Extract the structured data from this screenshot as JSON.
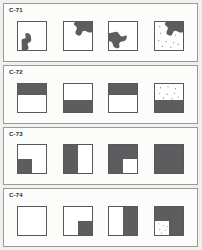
{
  "sheet": {
    "background_color": "#f0f0ee",
    "panel_background": "#fcfcfa",
    "panel_border_color": "#9a9a96",
    "fill_color": "#5d5d60",
    "cell_border_color": "#58585a"
  },
  "panels": [
    {
      "label": "C-71",
      "cells": [
        {
          "kind": "puzzle-piece",
          "position": "bottom-left",
          "dotted": false
        },
        {
          "kind": "puzzle-piece",
          "position": "top-right",
          "dotted": false
        },
        {
          "kind": "puzzle-piece",
          "position": "center-left",
          "dotted": false
        },
        {
          "kind": "puzzle-piece",
          "position": "top-right",
          "dotted": true
        }
      ]
    },
    {
      "label": "C-72",
      "cells": [
        {
          "kind": "band",
          "position": "top",
          "dotted": false
        },
        {
          "kind": "band",
          "position": "bottom",
          "dotted": false
        },
        {
          "kind": "band",
          "position": "top",
          "dotted": false
        },
        {
          "kind": "band",
          "position": "bottom",
          "dotted": true
        }
      ]
    },
    {
      "label": "C-73",
      "cells": [
        {
          "kind": "quadrants",
          "filled": [
            "bottom-left"
          ],
          "dotted": false
        },
        {
          "kind": "quadrants",
          "filled": [
            "top-left",
            "bottom-left"
          ],
          "dotted": false
        },
        {
          "kind": "quadrants",
          "filled": [
            "top-left",
            "top-right",
            "bottom-left"
          ],
          "dotted": false
        },
        {
          "kind": "quadrants",
          "filled": [
            "top-left",
            "top-right",
            "bottom-left",
            "bottom-right"
          ],
          "dotted": false
        }
      ]
    },
    {
      "label": "C-74",
      "cells": [
        {
          "kind": "quadrants",
          "filled": [],
          "dotted": false
        },
        {
          "kind": "quadrants",
          "filled": [
            "bottom-right"
          ],
          "dotted": false
        },
        {
          "kind": "quadrants",
          "filled": [
            "top-right",
            "bottom-right"
          ],
          "dotted": false
        },
        {
          "kind": "quadrants",
          "filled": [
            "top-left",
            "top-right",
            "bottom-right"
          ],
          "dotted": true
        }
      ]
    }
  ]
}
